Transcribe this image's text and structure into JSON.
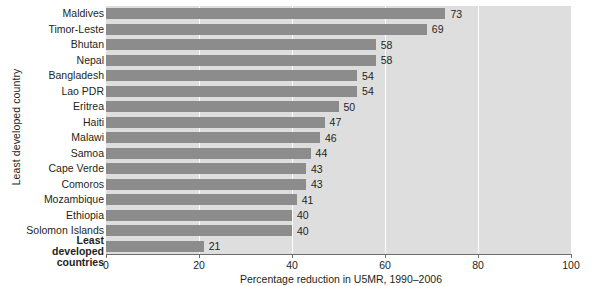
{
  "chart_data": {
    "type": "bar",
    "orientation": "horizontal",
    "title": "",
    "xlabel": "Percentage reduction in U5MR, 1990–2006",
    "ylabel": "Least developed country",
    "xlim": [
      0,
      100
    ],
    "xticks": [
      0,
      20,
      40,
      60,
      80,
      100
    ],
    "xtick_labels": [
      "0",
      "20",
      "40",
      "60",
      "80",
      "100"
    ],
    "gridlines": [
      20,
      40,
      60,
      80
    ],
    "grid": true,
    "legend": null,
    "categories": [
      "Maldives",
      "Timor-Leste",
      "Bhutan",
      "Nepal",
      "Bangladesh",
      "Lao PDR",
      "Eritrea",
      "Haiti",
      "Malawi",
      "Samoa",
      "Cape Verde",
      "Comoros",
      "Mozambique",
      "Ethiopia",
      "Solomon Islands",
      "Least developed\ncountries"
    ],
    "values": [
      73,
      69,
      58,
      58,
      54,
      54,
      50,
      47,
      46,
      44,
      43,
      43,
      41,
      40,
      40,
      21
    ],
    "value_labels": [
      "73",
      "69",
      "58",
      "58",
      "54",
      "54",
      "50",
      "47",
      "46",
      "44",
      "43",
      "43",
      "41",
      "40",
      "40",
      "21"
    ],
    "emphasized_index": 15,
    "colors": {
      "bar": "#8c8c8c",
      "plot_background": "#dedede",
      "gridline": "#ffffff",
      "axis": "#6d6d6d",
      "text": "#231f20",
      "page_background": "#ffffff"
    }
  }
}
